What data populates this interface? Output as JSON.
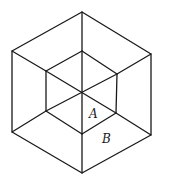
{
  "diagram": {
    "type": "hexagonal-projection-of-nested-cubes",
    "stroke_color": "#1a1a1a",
    "background": "#ffffff",
    "center": [
      81,
      93
    ],
    "outer_hexagon": [
      [
        82,
        12
      ],
      [
        151,
        54
      ],
      [
        151,
        135
      ],
      [
        82,
        173
      ],
      [
        12,
        132
      ],
      [
        12,
        51
      ]
    ],
    "inner_hexagon": [
      [
        82,
        51
      ],
      [
        117,
        74
      ],
      [
        116,
        113
      ],
      [
        82,
        134
      ],
      [
        46,
        111
      ],
      [
        46,
        71
      ]
    ],
    "labels": [
      {
        "id": "A",
        "text": "A",
        "x": 89,
        "y": 108
      },
      {
        "id": "B",
        "text": "B",
        "x": 102,
        "y": 133
      }
    ]
  }
}
